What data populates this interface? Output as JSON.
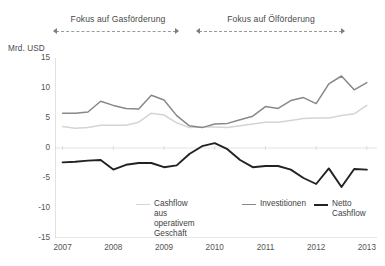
{
  "annotations": {
    "brackets": [
      {
        "label": "Fokus auf Gasförderung",
        "from": 2007,
        "to": 2009.4
      },
      {
        "label": "Fokus auf Ölförderung",
        "from": 2009.8,
        "to": 2012.7
      }
    ]
  },
  "legend": {
    "items": [
      {
        "label": "Cashflow aus\noperativem Geschäft",
        "color": "#d4d4d4"
      },
      {
        "label": "Investitionen",
        "color": "#888888"
      },
      {
        "label": "Netto Cashflow",
        "color": "#222222"
      }
    ]
  },
  "chart_data": {
    "type": "line",
    "title": "",
    "subtitle": "",
    "xlabel": "",
    "ylabel": "Mrd. USD",
    "ylim": [
      -15,
      15
    ],
    "xlim": [
      2006.85,
      2013.2
    ],
    "yticks": [
      15,
      10,
      5,
      0,
      -5,
      -10,
      -15
    ],
    "xticks": [
      2007,
      2008,
      2009,
      2010,
      2011,
      2012,
      2013
    ],
    "xtick_labels": [
      "2007",
      "2008",
      "2009",
      "2010",
      "2011",
      "2012",
      "2013"
    ],
    "ytick_labels": [
      "15",
      "10",
      "5",
      "0",
      "-5",
      "-10",
      "-15"
    ],
    "grid": false,
    "zero_line": true,
    "legend_position": "bottom",
    "x": [
      2007.0,
      2007.25,
      2007.5,
      2007.75,
      2008.0,
      2008.25,
      2008.5,
      2008.75,
      2009.0,
      2009.25,
      2009.5,
      2009.75,
      2010.0,
      2010.25,
      2010.5,
      2010.75,
      2011.0,
      2011.25,
      2011.5,
      2011.75,
      2012.0,
      2012.25,
      2012.5,
      2012.75,
      2013.0
    ],
    "series": [
      {
        "name": "Investitionen",
        "color": "#888888",
        "values": [
          5.8,
          5.8,
          6.0,
          7.8,
          7.1,
          6.6,
          6.5,
          8.8,
          8.0,
          5.4,
          3.7,
          3.4,
          4.0,
          4.1,
          4.7,
          5.3,
          6.9,
          6.6,
          7.9,
          8.4,
          7.4,
          10.7,
          12.0,
          9.7,
          10.9
        ]
      },
      {
        "name": "Cashflow aus operativem Geschäft",
        "color": "#d4d4d4",
        "values": [
          3.6,
          3.3,
          3.4,
          3.8,
          3.8,
          3.8,
          4.3,
          5.8,
          5.5,
          4.2,
          3.4,
          3.5,
          3.5,
          3.4,
          3.7,
          4.0,
          4.3,
          4.3,
          4.6,
          4.9,
          5.0,
          5.0,
          5.4,
          5.7,
          7.1
        ]
      },
      {
        "name": "Netto Cashflow",
        "color": "#222222",
        "values": [
          -2.4,
          -2.3,
          -2.1,
          -2.0,
          -3.6,
          -2.8,
          -2.5,
          -2.5,
          -3.2,
          -2.9,
          -1.0,
          0.3,
          0.8,
          -0.2,
          -2.0,
          -3.2,
          -3.0,
          -3.0,
          -3.6,
          -5.0,
          -6.0,
          -3.4,
          -6.5,
          -3.5,
          -3.6
        ]
      }
    ]
  }
}
